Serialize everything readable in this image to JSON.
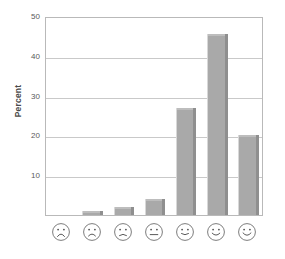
{
  "chart_data": {
    "type": "bar",
    "title": "",
    "subtitle": "",
    "xlabel": "",
    "ylabel": "Percent",
    "ylim": [
      0,
      50
    ],
    "yticks": [
      10,
      20,
      30,
      40,
      50
    ],
    "grid": true,
    "legend": null,
    "categories": [
      "very-unhappy-face",
      "unhappy-face",
      "slightly-unhappy-face",
      "neutral-face",
      "slightly-happy-face",
      "happy-face",
      "very-happy-face"
    ],
    "category_labels": [
      "face-1-frown",
      "face-2-frown",
      "face-3-slight-frown",
      "face-4-neutral",
      "face-5-slight-smile",
      "face-6-smile",
      "face-7-smile"
    ],
    "values": [
      0,
      1,
      2,
      4,
      27,
      45.5,
      20
    ],
    "bar_color": "#a9a9a9",
    "bar_edge_color": "#8f8f8f",
    "grid_color": "#c9c9c9",
    "frame_color": "#b9b9b9",
    "background": "#ffffff"
  },
  "axis": {
    "y_label": "Percent",
    "y_ticks": [
      "50",
      "40",
      "30",
      "20",
      "10"
    ]
  },
  "caption": {
    "text": ""
  }
}
